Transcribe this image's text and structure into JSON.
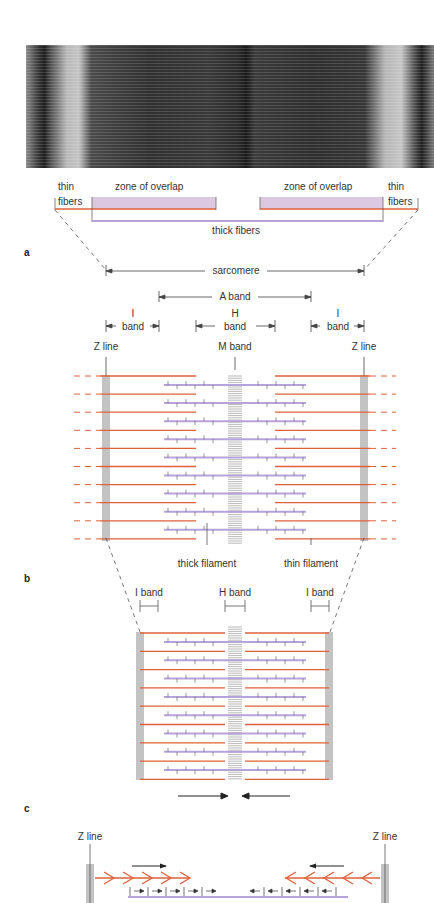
{
  "panels": {
    "a": {
      "letter": "a",
      "micrograph_description": "electron micrograph of sarcomere",
      "labels": {
        "thin_fibers_left_1": "thin",
        "thin_fibers_left_2": "fibers",
        "zone_of_overlap_left": "zone of overlap",
        "zone_of_overlap_right": "zone of overlap",
        "thin_fibers_right_1": "thin",
        "thin_fibers_right_2": "fibers",
        "thick_fibers": "thick fibers"
      }
    },
    "b": {
      "letter": "b",
      "labels": {
        "sarcomere": "sarcomere",
        "a_band": "A band",
        "i_band_left_1": "I",
        "i_band_left_2": "band",
        "h_band_1": "H",
        "h_band_2": "band",
        "i_band_right_1": "I",
        "i_band_right_2": "band",
        "z_line_left": "Z line",
        "m_band": "M band",
        "z_line_right": "Z line",
        "thick_filament": "thick filament",
        "thin_filament": "thin filament"
      },
      "filament_rows": 10
    },
    "c": {
      "letter": "c",
      "labels": {
        "i_band_left": "I band",
        "h_band": "H band",
        "i_band_right": "I band"
      },
      "filament_rows": 8
    },
    "d": {
      "labels": {
        "z_line_left": "Z line",
        "z_line_right": "Z line"
      }
    }
  },
  "colors": {
    "thin_filament": "#e0603a",
    "thick_filament": "#b7a3dc",
    "overlap_zone": "#dcc8e0",
    "z_line": "#555555",
    "text": "#333333"
  }
}
